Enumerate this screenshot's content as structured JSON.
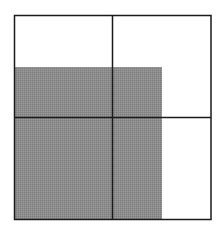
{
  "diagram": {
    "outer_square": {
      "x": 14.5,
      "y": 15.5,
      "width": 196.5,
      "height": 204
    },
    "grid": {
      "rows": 2,
      "cols": 2,
      "divider_x": 112.5,
      "divider_y": 117.5
    },
    "shaded_region": {
      "x": 15,
      "y": 67,
      "width": 147,
      "height": 152
    },
    "colors": {
      "background": "#ffffff",
      "stroke": "#1a1a1a",
      "shade": "#8c8c8c"
    }
  }
}
